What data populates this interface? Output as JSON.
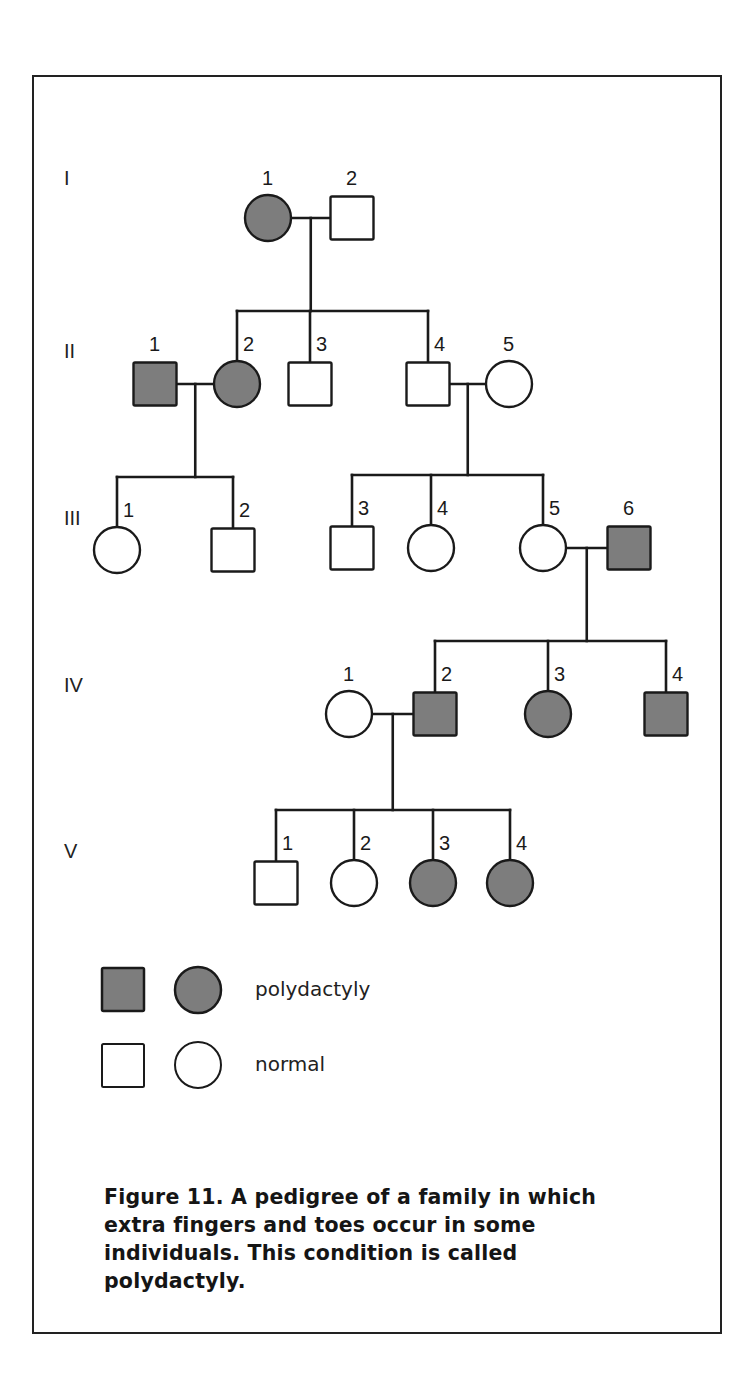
{
  "figure": {
    "caption": "Figure 11. A pedigree of a family in which extra fingers and toes occur in some individuals. This condition is called polydactyly.",
    "caption_lines": [
      "Figure 11. A pedigree of a family in which",
      "extra fingers and toes occur in some",
      "individuals. This condition is called",
      "polydactyly."
    ],
    "colors": {
      "affected_fill": "#7d7d7d",
      "stroke": "#1a1a1a",
      "normal_fill": "#ffffff"
    }
  },
  "legend": {
    "affected_label": "polydactyly",
    "normal_label": "normal"
  },
  "generations": [
    {
      "label": "I",
      "y": 185
    },
    {
      "label": "II",
      "y": 358
    },
    {
      "label": "III",
      "y": 525
    },
    {
      "label": "IV",
      "y": 692
    },
    {
      "label": "V",
      "y": 858
    }
  ],
  "individuals": [
    {
      "id": "I-1",
      "gen": "I",
      "num": "1",
      "sex": "female",
      "affected": true,
      "cx": 268,
      "cy": 218
    },
    {
      "id": "I-2",
      "gen": "I",
      "num": "2",
      "sex": "male",
      "affected": false,
      "cx": 352,
      "cy": 218
    },
    {
      "id": "II-1",
      "gen": "II",
      "num": "1",
      "sex": "male",
      "affected": true,
      "cx": 155,
      "cy": 384
    },
    {
      "id": "II-2",
      "gen": "II",
      "num": "2",
      "sex": "female",
      "affected": true,
      "cx": 237,
      "cy": 384
    },
    {
      "id": "II-3",
      "gen": "II",
      "num": "3",
      "sex": "male",
      "affected": false,
      "cx": 310,
      "cy": 384
    },
    {
      "id": "II-4",
      "gen": "II",
      "num": "4",
      "sex": "male",
      "affected": false,
      "cx": 428,
      "cy": 384
    },
    {
      "id": "II-5",
      "gen": "II",
      "num": "5",
      "sex": "female",
      "affected": false,
      "cx": 509,
      "cy": 384
    },
    {
      "id": "III-1",
      "gen": "III",
      "num": "1",
      "sex": "female",
      "affected": false,
      "cx": 117,
      "cy": 550
    },
    {
      "id": "III-2",
      "gen": "III",
      "num": "2",
      "sex": "male",
      "affected": false,
      "cx": 233,
      "cy": 550
    },
    {
      "id": "III-3",
      "gen": "III",
      "num": "3",
      "sex": "male",
      "affected": false,
      "cx": 352,
      "cy": 548
    },
    {
      "id": "III-4",
      "gen": "III",
      "num": "4",
      "sex": "female",
      "affected": false,
      "cx": 431,
      "cy": 548
    },
    {
      "id": "III-5",
      "gen": "III",
      "num": "5",
      "sex": "female",
      "affected": false,
      "cx": 543,
      "cy": 548
    },
    {
      "id": "III-6",
      "gen": "III",
      "num": "6",
      "sex": "male",
      "affected": true,
      "cx": 629,
      "cy": 548
    },
    {
      "id": "IV-1",
      "gen": "IV",
      "num": "1",
      "sex": "female",
      "affected": false,
      "cx": 349,
      "cy": 714
    },
    {
      "id": "IV-2",
      "gen": "IV",
      "num": "2",
      "sex": "male",
      "affected": true,
      "cx": 435,
      "cy": 714
    },
    {
      "id": "IV-3",
      "gen": "IV",
      "num": "3",
      "sex": "female",
      "affected": true,
      "cx": 548,
      "cy": 714
    },
    {
      "id": "IV-4",
      "gen": "IV",
      "num": "4",
      "sex": "male",
      "affected": true,
      "cx": 666,
      "cy": 714
    },
    {
      "id": "V-1",
      "gen": "V",
      "num": "1",
      "sex": "male",
      "affected": false,
      "cx": 276,
      "cy": 883
    },
    {
      "id": "V-2",
      "gen": "V",
      "num": "2",
      "sex": "female",
      "affected": false,
      "cx": 354,
      "cy": 883
    },
    {
      "id": "V-3",
      "gen": "V",
      "num": "3",
      "sex": "female",
      "affected": true,
      "cx": 433,
      "cy": 883
    },
    {
      "id": "V-4",
      "gen": "V",
      "num": "4",
      "sex": "female",
      "affected": true,
      "cx": 510,
      "cy": 883
    }
  ],
  "matings": [
    {
      "partners": [
        "I-1",
        "I-2"
      ],
      "children": [
        "II-2",
        "II-3",
        "II-4"
      ]
    },
    {
      "partners": [
        "II-1",
        "II-2"
      ],
      "children": [
        "III-1",
        "III-2"
      ]
    },
    {
      "partners": [
        "II-4",
        "II-5"
      ],
      "children": [
        "III-3",
        "III-4",
        "III-5"
      ]
    },
    {
      "partners": [
        "III-5",
        "III-6"
      ],
      "children": [
        "IV-2",
        "IV-3",
        "IV-4"
      ]
    },
    {
      "partners": [
        "IV-1",
        "IV-2"
      ],
      "children": [
        "V-1",
        "V-2",
        "V-3",
        "V-4"
      ]
    }
  ]
}
